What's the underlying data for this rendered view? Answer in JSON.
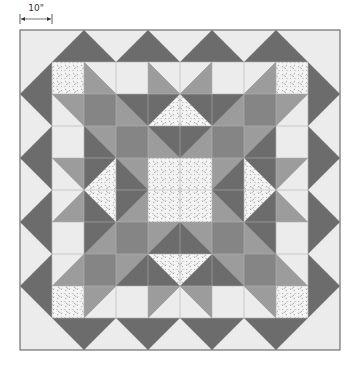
{
  "dimension": {
    "label": "10\"",
    "x1": 20,
    "x2": 52,
    "y": 19
  },
  "colors": {
    "background": "#ffffff",
    "light": "#ececec",
    "medium": "#9c9c9c",
    "medium_dark": "#858585",
    "dark": "#6c6c6c",
    "print_base": "#f4f4f4",
    "print_speck": "#8a8a8a",
    "outline": "#555555",
    "seam": "#b4b4b4"
  },
  "quilt": {
    "outer": {
      "x": 20,
      "y": 30,
      "w": 320,
      "h": 320
    },
    "inner": {
      "x": 52,
      "y": 62,
      "cell": 32,
      "cols": 8,
      "rows": 8
    },
    "border_zigzag": {
      "description": "dark zigzag flying-geese border with light background triangles",
      "peaks_top_x": [
        84,
        148,
        212,
        276
      ],
      "peaks_side_y": [
        94,
        158,
        222,
        286
      ]
    },
    "quadrant_shapes": [
      {
        "fill": "print",
        "pts": "52,62 84,62 84,94 52,94"
      },
      {
        "fill": "light",
        "pts": "84,62 116,62 116,94"
      },
      {
        "fill": "medium",
        "pts": "84,62 116,94 84,94"
      },
      {
        "fill": "light",
        "pts": "116,62 148,62 148,94 116,94"
      },
      {
        "fill": "light",
        "pts": "148,62 180,62 180,94"
      },
      {
        "fill": "medium",
        "pts": "148,62 180,94 148,94"
      },
      {
        "fill": "medium",
        "pts": "52,94 84,94 84,126"
      },
      {
        "fill": "light",
        "pts": "52,94 84,126 52,126"
      },
      {
        "fill": "medium_dark",
        "pts": "84,94 116,94 116,126 84,126"
      },
      {
        "fill": "dark",
        "pts": "116,94 148,94 148,126"
      },
      {
        "fill": "medium",
        "pts": "116,94 148,126 116,126"
      },
      {
        "fill": "dark",
        "pts": "148,94 180,94 148,126"
      },
      {
        "fill": "print",
        "pts": "180,94 180,126 148,126"
      },
      {
        "fill": "light",
        "pts": "52,126 84,126 84,158 52,158"
      },
      {
        "fill": "medium",
        "pts": "84,126 116,126 116,158"
      },
      {
        "fill": "dark",
        "pts": "84,126 116,158 84,158"
      },
      {
        "fill": "medium_dark",
        "pts": "116,126 148,126 148,158 116,158"
      },
      {
        "fill": "dark",
        "pts": "148,126 180,126 180,158"
      },
      {
        "fill": "medium",
        "pts": "148,126 180,158 148,158"
      },
      {
        "fill": "medium",
        "pts": "52,158 84,158 84,190"
      },
      {
        "fill": "light",
        "pts": "52,158 84,190 52,190"
      },
      {
        "fill": "dark",
        "pts": "84,158 116,158 84,190"
      },
      {
        "fill": "print",
        "pts": "116,158 116,190 84,190"
      },
      {
        "fill": "medium",
        "pts": "116,158 148,158 148,190"
      },
      {
        "fill": "dark",
        "pts": "116,158 148,190 116,190"
      },
      {
        "fill": "print",
        "pts": "148,158 180,158 180,190 148,190"
      }
    ],
    "border_shapes": [
      {
        "fill": "dark",
        "pts": "20,94 84,30 116,62 148,30 180,62 180,62 180,62 52,62 52,62 52,94 20,94"
      }
    ]
  }
}
